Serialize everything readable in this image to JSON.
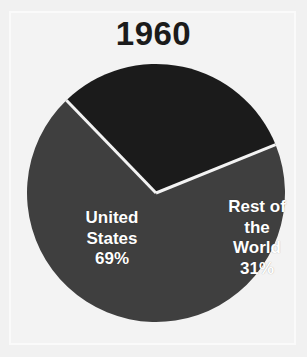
{
  "figure": {
    "background_color": "#f1f1f1",
    "frame_color": "#fafafa"
  },
  "chart_data": {
    "type": "pie",
    "title": "1960",
    "xlabel": "",
    "ylabel": "",
    "categories": [
      "United States",
      "Rest of the World"
    ],
    "values": [
      69,
      31
    ],
    "value_unit": "%",
    "labels_inside": true,
    "legend": "none",
    "grid": false,
    "slices": [
      {
        "name": "United States",
        "name_line_1": "United",
        "name_line_2": "States",
        "value": 69,
        "value_label": "69%",
        "color": "#3f3f3f",
        "start_angle_deg": 68,
        "end_angle_deg": 316
      },
      {
        "name": "Rest of the World",
        "name_line_1": "Rest of",
        "name_line_2": "the",
        "name_line_3": "World",
        "value": 31,
        "value_label": "31%",
        "color": "#1b1b1b",
        "start_angle_deg": 316,
        "end_angle_deg": 68
      }
    ],
    "separator_color": "#f3f3f3",
    "label_text_color": "#ffffff"
  }
}
